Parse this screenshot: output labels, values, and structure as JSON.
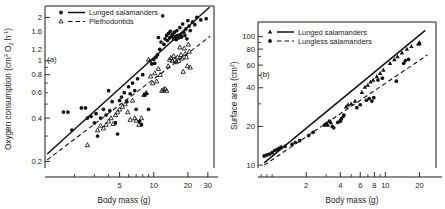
{
  "figure": {
    "panels": [
      {
        "id": "a",
        "label": "(a)",
        "xlabel": "Body mass (g)",
        "ylabel_main": "Oxygen consumption (cm",
        "ylabel_sup1": "3",
        "ylabel_mid": " O",
        "ylabel_sub": "2",
        "ylabel_tail": " h",
        "ylabel_sup2": "-1",
        "ylabel_close": ")",
        "legend": [
          {
            "label": "Lunged salamanders",
            "marker": "filled-circle",
            "line": "solid"
          },
          {
            "label": "Plethodontids",
            "marker": "open-triangle",
            "line": "dashed"
          }
        ],
        "xticks": [
          "5",
          "10",
          "20",
          "30"
        ],
        "yticks": [
          "0.2",
          "0.4",
          "0.6",
          "0.8",
          "1.0",
          "1.2",
          "1.6",
          "2.0"
        ]
      },
      {
        "id": "b",
        "label": "(b)",
        "xlabel": "Body mass (g)",
        "ylabel_main": "Surface area (cm",
        "ylabel_sup1": "2",
        "ylabel_close": ")",
        "legend": [
          {
            "label": "Lunged salamanders",
            "marker": "filled-triangle",
            "line": "solid"
          },
          {
            "label": "Lungless salamanders",
            "marker": "filled-circle",
            "line": "dashed"
          }
        ],
        "xticks": [
          "2",
          "4",
          "6",
          "8",
          "10",
          "20"
        ],
        "yticks": [
          "10",
          "20",
          "40",
          "60",
          "80",
          "100"
        ]
      }
    ]
  },
  "chart_data": [
    {
      "type": "scatter",
      "panel": "(a)",
      "title": "",
      "xlabel": "Body mass (g)",
      "ylabel": "Oxygen consumption (cm3 O2 h-1)",
      "xscale": "log",
      "yscale": "log",
      "xlim": [
        1.1,
        34
      ],
      "ylim": [
        0.18,
        2.4
      ],
      "xticks": [
        5,
        10,
        20,
        30
      ],
      "yticks": [
        0.2,
        0.4,
        0.6,
        0.8,
        1.0,
        1.2,
        1.6,
        2.0
      ],
      "grid": false,
      "legend_position": "top-left",
      "series": [
        {
          "name": "Lunged salamanders",
          "marker": "filled-circle",
          "fit_line": "solid",
          "fit_endpoints": [
            [
              1.15,
              0.225
            ],
            [
              31.0,
              2.35
            ]
          ],
          "points": [
            [
              1.6,
              0.44
            ],
            [
              1.75,
              0.44
            ],
            [
              1.9,
              0.33
            ],
            [
              2.3,
              0.47
            ],
            [
              2.5,
              0.47
            ],
            [
              2.6,
              0.4
            ],
            [
              2.8,
              0.41
            ],
            [
              3.0,
              0.37
            ],
            [
              3.1,
              0.43
            ],
            [
              3.2,
              0.3
            ],
            [
              3.4,
              0.4
            ],
            [
              3.6,
              0.46
            ],
            [
              3.8,
              0.42
            ],
            [
              4.0,
              0.62
            ],
            [
              4.1,
              0.45
            ],
            [
              4.3,
              0.52
            ],
            [
              4.6,
              0.37
            ],
            [
              4.8,
              0.31
            ],
            [
              5.0,
              0.53
            ],
            [
              5.2,
              0.56
            ],
            [
              5.5,
              0.6
            ],
            [
              5.8,
              0.52
            ],
            [
              6.0,
              0.66
            ],
            [
              6.2,
              0.59
            ],
            [
              6.5,
              0.7
            ],
            [
              6.8,
              0.62
            ],
            [
              7.0,
              0.46
            ],
            [
              7.2,
              0.75
            ],
            [
              7.5,
              0.38
            ],
            [
              7.8,
              0.36
            ],
            [
              8.0,
              0.8
            ],
            [
              8.3,
              0.58
            ],
            [
              8.6,
              0.59
            ],
            [
              9.0,
              0.46
            ],
            [
              9.3,
              1.0
            ],
            [
              9.6,
              0.95
            ],
            [
              10.0,
              1.02
            ],
            [
              10.2,
              0.96
            ],
            [
              10.5,
              1.06
            ],
            [
              10.8,
              1.1
            ],
            [
              11.0,
              1.45
            ],
            [
              11.3,
              1.2
            ],
            [
              11.6,
              1.35
            ],
            [
              12.0,
              2.05
            ],
            [
              12.3,
              1.3
            ],
            [
              12.6,
              1.42
            ],
            [
              13.0,
              1.5
            ],
            [
              13.2,
              1.38
            ],
            [
              13.5,
              1.55
            ],
            [
              13.8,
              1.44
            ],
            [
              14.0,
              1.6
            ],
            [
              14.3,
              1.47
            ],
            [
              14.6,
              1.52
            ],
            [
              15.0,
              1.42
            ],
            [
              15.2,
              1.58
            ],
            [
              15.5,
              1.48
            ],
            [
              15.8,
              1.4
            ],
            [
              16.0,
              1.62
            ],
            [
              16.3,
              1.5
            ],
            [
              16.6,
              1.44
            ],
            [
              17.0,
              1.7
            ],
            [
              17.3,
              1.52
            ],
            [
              17.6,
              1.46
            ],
            [
              18.0,
              1.8
            ],
            [
              18.4,
              1.58
            ],
            [
              18.8,
              1.5
            ],
            [
              19.2,
              1.66
            ],
            [
              19.6,
              1.42
            ],
            [
              20.0,
              1.9
            ],
            [
              20.5,
              1.74
            ],
            [
              21.0,
              1.62
            ],
            [
              22.0,
              1.86
            ],
            [
              23.0,
              1.78
            ],
            [
              24.0,
              2.0
            ],
            [
              26.0,
              1.92
            ],
            [
              29.0,
              1.96
            ]
          ]
        },
        {
          "name": "Plethodontids",
          "marker": "open-triangle",
          "fit_line": "dashed",
          "fit_endpoints": [
            [
              1.15,
              0.205
            ],
            [
              31.5,
              1.48
            ]
          ],
          "points": [
            [
              2.6,
              0.26
            ],
            [
              3.2,
              0.33
            ],
            [
              3.4,
              0.355
            ],
            [
              3.6,
              0.34
            ],
            [
              3.8,
              0.36
            ],
            [
              4.0,
              0.38
            ],
            [
              4.2,
              0.4
            ],
            [
              4.4,
              0.365
            ],
            [
              4.6,
              0.42
            ],
            [
              4.8,
              0.44
            ],
            [
              5.0,
              0.46
            ],
            [
              5.3,
              0.48
            ],
            [
              5.6,
              0.5
            ],
            [
              5.9,
              0.44
            ],
            [
              6.2,
              0.39
            ],
            [
              6.5,
              0.53
            ],
            [
              6.8,
              0.4
            ],
            [
              7.0,
              0.385
            ],
            [
              7.4,
              0.36
            ],
            [
              7.8,
              0.4
            ],
            [
              8.2,
              0.58
            ],
            [
              8.6,
              0.6
            ],
            [
              9.0,
              1.02
            ],
            [
              9.4,
              0.78
            ],
            [
              9.8,
              0.7
            ],
            [
              10.2,
              0.82
            ],
            [
              10.6,
              0.72
            ],
            [
              11.0,
              0.88
            ],
            [
              11.4,
              0.8
            ],
            [
              11.8,
              0.62
            ],
            [
              12.2,
              0.63
            ],
            [
              12.6,
              0.64
            ],
            [
              13.0,
              0.62
            ],
            [
              13.4,
              0.92
            ],
            [
              13.8,
              1.02
            ],
            [
              14.2,
              1.05
            ],
            [
              14.6,
              1.0
            ],
            [
              15.0,
              1.08
            ],
            [
              15.4,
              1.02
            ],
            [
              15.8,
              0.98
            ],
            [
              16.2,
              1.06
            ],
            [
              16.6,
              1.0
            ],
            [
              17.0,
              1.24
            ],
            [
              17.4,
              1.1
            ],
            [
              17.8,
              1.04
            ],
            [
              18.2,
              0.84
            ],
            [
              18.6,
              1.22
            ],
            [
              19.0,
              1.12
            ],
            [
              19.4,
              1.06
            ],
            [
              19.8,
              0.92
            ],
            [
              20.2,
              1.3
            ],
            [
              20.6,
              1.16
            ],
            [
              21.0,
              0.9
            ]
          ]
        }
      ]
    },
    {
      "type": "scatter",
      "panel": "(b)",
      "title": "",
      "xlabel": "Body mass (g)",
      "ylabel": "Surface area (cm2)",
      "xscale": "log",
      "yscale": "log",
      "xlim": [
        0.75,
        28
      ],
      "ylim": [
        9.5,
        130
      ],
      "xticks": [
        2,
        4,
        6,
        8,
        10,
        20
      ],
      "yticks": [
        10,
        20,
        40,
        60,
        80,
        100
      ],
      "grid": false,
      "legend_position": "top-left",
      "series": [
        {
          "name": "Lunged salamanders",
          "marker": "filled-triangle",
          "fit_line": "solid",
          "fit_endpoints": [
            [
              0.85,
              10.4
            ],
            [
              22.5,
              112
            ]
          ],
          "points": [
            [
              3.0,
              21.0
            ],
            [
              3.1,
              20.5
            ],
            [
              3.3,
              21.5
            ],
            [
              4.0,
              22.5
            ],
            [
              4.2,
              24.0
            ],
            [
              4.5,
              28.5
            ],
            [
              4.7,
              29.5
            ],
            [
              5.0,
              30.0
            ],
            [
              5.4,
              31.5
            ],
            [
              6.2,
              37.0
            ],
            [
              6.6,
              40.5
            ],
            [
              7.0,
              42.0
            ],
            [
              7.4,
              44.5
            ],
            [
              7.8,
              46.0
            ],
            [
              8.4,
              49.0
            ],
            [
              9.0,
              52.0
            ],
            [
              9.6,
              55.0
            ],
            [
              11.0,
              62.0
            ],
            [
              12.0,
              66.5
            ],
            [
              12.8,
              70.0
            ],
            [
              14.0,
              75.0
            ],
            [
              15.5,
              80.0
            ],
            [
              17.0,
              84.0
            ],
            [
              19.5,
              88.0
            ],
            [
              20.0,
              90.0
            ]
          ]
        },
        {
          "name": "Lungless salamanders",
          "marker": "filled-circle",
          "fit_line": "dashed",
          "fit_endpoints": [
            [
              0.85,
              10.0
            ],
            [
              23.5,
              72
            ]
          ],
          "points": [
            [
              0.85,
              11.8
            ],
            [
              0.9,
              12.0
            ],
            [
              0.95,
              12.2
            ],
            [
              1.0,
              12.5
            ],
            [
              1.05,
              13.0
            ],
            [
              1.1,
              13.2
            ],
            [
              1.15,
              13.5
            ],
            [
              1.2,
              13.8
            ],
            [
              1.3,
              14.0
            ],
            [
              1.5,
              14.5
            ],
            [
              1.6,
              15.0
            ],
            [
              1.75,
              15.5
            ],
            [
              2.1,
              17.0
            ],
            [
              2.3,
              18.0
            ],
            [
              2.9,
              20.5
            ],
            [
              3.0,
              21.0
            ],
            [
              3.2,
              22.0
            ],
            [
              3.4,
              20.0
            ],
            [
              3.5,
              19.5
            ],
            [
              3.8,
              21.5
            ],
            [
              4.0,
              22.0
            ],
            [
              4.1,
              23.0
            ],
            [
              4.3,
              24.5
            ],
            [
              5.6,
              28.0
            ],
            [
              6.0,
              29.5
            ],
            [
              6.8,
              32.0
            ],
            [
              7.2,
              33.0
            ],
            [
              7.6,
              31.5
            ],
            [
              7.9,
              33.5
            ],
            [
              8.6,
              46.0
            ],
            [
              9.4,
              47.5
            ],
            [
              12.5,
              45.0
            ],
            [
              14.5,
              62.0
            ],
            [
              15.0,
              65.0
            ],
            [
              16.0,
              66.5
            ],
            [
              20.0,
              88.0
            ]
          ]
        }
      ]
    }
  ]
}
